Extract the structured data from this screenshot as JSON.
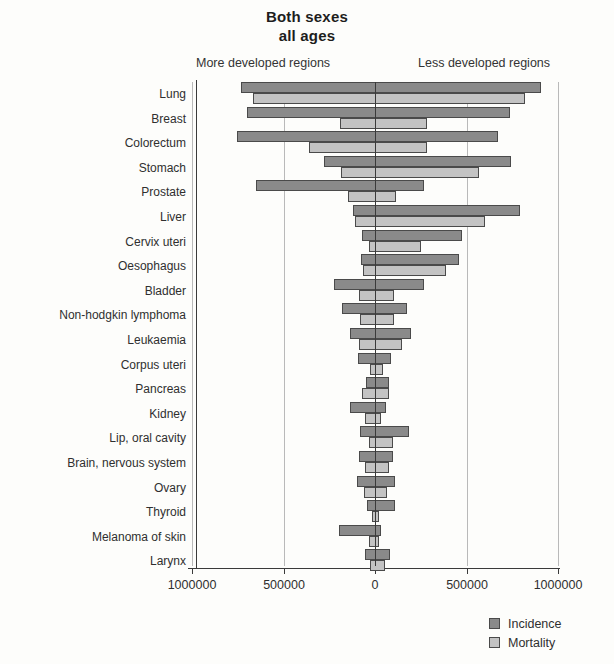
{
  "chart_data": {
    "type": "bar",
    "orientation": "horizontal",
    "layout": "bidirectional-pyramid",
    "title": "Both sexes",
    "subtitle": "all ages",
    "left_side_label": "More developed regions",
    "right_side_label": "Less developed regions",
    "xlabel": "",
    "ylabel": "",
    "xlim": [
      -1000000,
      1000000
    ],
    "xticks": [
      -1000000,
      -500000,
      0,
      500000,
      1000000
    ],
    "xtick_labels": [
      "1000000",
      "500000",
      "0",
      "500000",
      "1000000"
    ],
    "grid": true,
    "legend_position": "bottom-right",
    "legend": [
      "Incidence",
      "Mortality"
    ],
    "colors": {
      "incidence": "#8a8a8a",
      "mortality": "#c3c3c3",
      "axis": "#3a3a3a",
      "grid": "#b9b9b9"
    },
    "categories": [
      "Lung",
      "Breast",
      "Colorectum",
      "Stomach",
      "Prostate",
      "Liver",
      "Cervix uteri",
      "Oesophagus",
      "Bladder",
      "Non-hodgkin lymphoma",
      "Leukaemia",
      "Corpus uteri",
      "Pancreas",
      "Kidney",
      "Lip, oral cavity",
      "Brain, nervous system",
      "Ovary",
      "Thyroid",
      "Melanoma of skin",
      "Larynx"
    ],
    "series": [
      {
        "name": "Incidence",
        "more_developed": [
          733000,
          700000,
          755000,
          279000,
          650000,
          120000,
          71000,
          75000,
          224000,
          180000,
          135000,
          94000,
          51000,
          135000,
          82000,
          86000,
          97000,
          45000,
          195000,
          53000
        ],
        "less_developed": [
          907000,
          738000,
          672000,
          744000,
          268000,
          792000,
          473000,
          458000,
          268000,
          175000,
          195000,
          90000,
          78000,
          60000,
          185000,
          96000,
          108000,
          112000,
          35000,
          83000
        ]
      },
      {
        "name": "Mortality",
        "more_developed": [
          666000,
          189000,
          359000,
          186000,
          145000,
          107000,
          31000,
          66000,
          86000,
          80000,
          88000,
          26000,
          69000,
          56000,
          31000,
          52000,
          58000,
          15000,
          33000,
          29000
        ]
      }
    ]
  },
  "bars": [
    {
      "category": "Lung",
      "incidence_left": 733000,
      "incidence_right": 907000,
      "mortality_left": 666000,
      "mortality_right": 822000
    },
    {
      "category": "Breast",
      "incidence_left": 700000,
      "incidence_right": 738000,
      "mortality_left": 189000,
      "mortality_right": 284000
    },
    {
      "category": "Colorectum",
      "incidence_left": 755000,
      "incidence_right": 672000,
      "mortality_left": 359000,
      "mortality_right": 284000
    },
    {
      "category": "Stomach",
      "incidence_left": 279000,
      "incidence_right": 744000,
      "mortality_left": 186000,
      "mortality_right": 568000
    },
    {
      "category": "Prostate",
      "incidence_left": 650000,
      "incidence_right": 268000,
      "mortality_left": 145000,
      "mortality_right": 117000
    },
    {
      "category": "Liver",
      "incidence_left": 120000,
      "incidence_right": 792000,
      "mortality_left": 107000,
      "mortality_right": 601000
    },
    {
      "category": "Cervix uteri",
      "incidence_left": 71000,
      "incidence_right": 473000,
      "mortality_left": 31000,
      "mortality_right": 254000
    },
    {
      "category": "Oesophagus",
      "incidence_left": 75000,
      "incidence_right": 458000,
      "mortality_left": 66000,
      "mortality_right": 390000
    },
    {
      "category": "Bladder",
      "incidence_left": 224000,
      "incidence_right": 268000,
      "mortality_left": 86000,
      "mortality_right": 105000
    },
    {
      "category": "Non-hodgkin lymphoma",
      "incidence_left": 180000,
      "incidence_right": 175000,
      "mortality_left": 80000,
      "mortality_right": 105000
    },
    {
      "category": "Leukaemia",
      "incidence_left": 135000,
      "incidence_right": 195000,
      "mortality_left": 88000,
      "mortality_right": 150000
    },
    {
      "category": "Corpus uteri",
      "incidence_left": 94000,
      "incidence_right": 90000,
      "mortality_left": 26000,
      "mortality_right": 45000
    },
    {
      "category": "Pancreas",
      "incidence_left": 51000,
      "incidence_right": 78000,
      "mortality_left": 69000,
      "mortality_right": 78000
    },
    {
      "category": "Kidney",
      "incidence_left": 135000,
      "incidence_right": 60000,
      "mortality_left": 56000,
      "mortality_right": 31000
    },
    {
      "category": "Lip, oral cavity",
      "incidence_left": 82000,
      "incidence_right": 185000,
      "mortality_left": 31000,
      "mortality_right": 97000
    },
    {
      "category": "Brain, nervous system",
      "incidence_left": 86000,
      "incidence_right": 96000,
      "mortality_left": 52000,
      "mortality_right": 78000
    },
    {
      "category": "Ovary",
      "incidence_left": 97000,
      "incidence_right": 108000,
      "mortality_left": 58000,
      "mortality_right": 66000
    },
    {
      "category": "Thyroid",
      "incidence_left": 45000,
      "incidence_right": 112000,
      "mortality_left": 15000,
      "mortality_right": 22000
    },
    {
      "category": "Melanoma of skin",
      "incidence_left": 195000,
      "incidence_right": 35000,
      "mortality_left": 33000,
      "mortality_right": 22000
    },
    {
      "category": "Larynx",
      "incidence_left": 53000,
      "incidence_right": 83000,
      "mortality_left": 29000,
      "mortality_right": 53000
    }
  ],
  "legend": {
    "items": [
      {
        "label": "Incidence",
        "swatch": "incidence"
      },
      {
        "label": "Mortality",
        "swatch": "mortality"
      }
    ]
  }
}
